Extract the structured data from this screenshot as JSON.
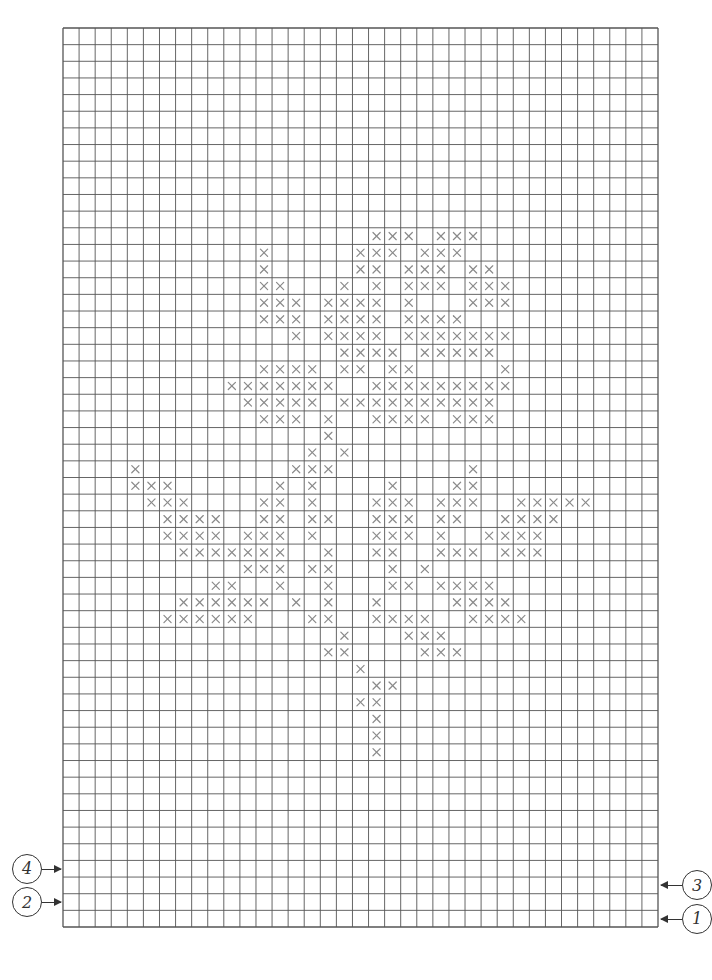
{
  "chart": {
    "type": "cross-stitch-grid",
    "columns": 37,
    "rows": 54,
    "grid_left": 63,
    "grid_top": 28,
    "grid_right": 658,
    "grid_bottom": 927,
    "line_color": "#555555",
    "mark_color": "#8a8a8a",
    "mark_symbol": "×"
  },
  "row_markers": [
    {
      "label": "4",
      "side": "left",
      "row": 50
    },
    {
      "label": "3",
      "side": "right",
      "row": 51
    },
    {
      "label": "2",
      "side": "left",
      "row": 52
    },
    {
      "label": "1",
      "side": "right",
      "row": 53
    }
  ],
  "stitches": {
    "12": [
      19,
      20,
      21,
      23,
      24,
      25
    ],
    "13": [
      12,
      18,
      19,
      20,
      22,
      23,
      24
    ],
    "14": [
      12,
      18,
      19,
      21,
      22,
      23,
      25,
      26
    ],
    "15": [
      12,
      13,
      17,
      19,
      21,
      22,
      23,
      25,
      26,
      27
    ],
    "16": [
      12,
      13,
      14,
      16,
      17,
      18,
      19,
      21,
      25,
      26,
      27
    ],
    "17": [
      12,
      13,
      14,
      16,
      17,
      18,
      19,
      21,
      22,
      23,
      24
    ],
    "18": [
      14,
      16,
      17,
      18,
      19,
      21,
      22,
      23,
      24,
      25,
      26,
      27
    ],
    "19": [
      17,
      18,
      19,
      20,
      22,
      23,
      24,
      25,
      26
    ],
    "20": [
      12,
      13,
      14,
      15,
      17,
      18,
      20,
      21,
      27
    ],
    "21": [
      10,
      11,
      12,
      13,
      14,
      15,
      16,
      19,
      20,
      21,
      22,
      23,
      24,
      25,
      26,
      27
    ],
    "22": [
      11,
      12,
      13,
      14,
      15,
      17,
      18,
      19,
      20,
      21,
      22,
      23,
      24,
      25,
      26
    ],
    "23": [
      12,
      13,
      14,
      16,
      19,
      20,
      21,
      22,
      24,
      25,
      26
    ],
    "24": [
      16
    ],
    "25": [
      15,
      17
    ],
    "26": [
      4,
      14,
      15,
      16,
      25
    ],
    "27": [
      4,
      5,
      6,
      13,
      15,
      20,
      24,
      25
    ],
    "28": [
      5,
      6,
      7,
      12,
      13,
      15,
      19,
      20,
      21,
      23,
      24,
      25,
      28,
      29,
      30,
      31,
      32
    ],
    "29": [
      6,
      7,
      8,
      9,
      12,
      13,
      15,
      16,
      19,
      20,
      21,
      23,
      24,
      27,
      28,
      29,
      30
    ],
    "30": [
      6,
      7,
      8,
      9,
      11,
      12,
      13,
      15,
      19,
      20,
      21,
      23,
      26,
      27,
      28,
      29
    ],
    "31": [
      7,
      8,
      9,
      10,
      11,
      12,
      13,
      16,
      19,
      20,
      23,
      24,
      25,
      27,
      28,
      29
    ],
    "32": [
      11,
      12,
      13,
      15,
      16,
      20,
      22
    ],
    "33": [
      9,
      10,
      13,
      16,
      20,
      21,
      23,
      24,
      25,
      26
    ],
    "34": [
      7,
      8,
      9,
      10,
      11,
      12,
      14,
      16,
      19,
      24,
      25,
      26,
      27
    ],
    "35": [
      6,
      7,
      8,
      9,
      10,
      11,
      15,
      16,
      19,
      20,
      21,
      22,
      25,
      26,
      27,
      28
    ],
    "36": [
      17,
      21,
      22,
      23
    ],
    "37": [
      16,
      17,
      22,
      23,
      24
    ],
    "38": [
      18
    ],
    "39": [
      19,
      20
    ],
    "40": [
      18,
      19
    ],
    "41": [
      19
    ],
    "42": [
      19
    ],
    "43": [
      19
    ]
  }
}
